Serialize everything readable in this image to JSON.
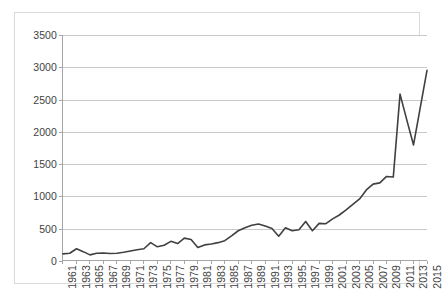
{
  "chart_data": {
    "type": "line",
    "title": "",
    "subtitle": "",
    "xlabel": "",
    "ylabel": "",
    "xlim": [
      1961,
      2015
    ],
    "ylim": [
      0,
      3500
    ],
    "ytick_step": 500,
    "yticks": [
      0,
      500,
      1000,
      1500,
      2000,
      2500,
      3000,
      3500
    ],
    "ytick_labels": [
      "0",
      "500",
      "1000",
      "1500",
      "2000",
      "2500",
      "3000",
      "3500"
    ],
    "xticks": [
      1961,
      1963,
      1965,
      1967,
      1969,
      1971,
      1973,
      1975,
      1977,
      1979,
      1981,
      1983,
      1985,
      1987,
      1989,
      1991,
      1993,
      1995,
      1997,
      1999,
      2001,
      2003,
      2005,
      2007,
      2009,
      2011,
      2013,
      2015
    ],
    "xtick_labels": [
      "1961",
      "1963",
      "1965",
      "1967",
      "1969",
      "1971",
      "1973",
      "1975",
      "1977",
      "1979",
      "1981",
      "1983",
      "1985",
      "1987",
      "1989",
      "1991",
      "1993",
      "1995",
      "1997",
      "1999",
      "2001",
      "2003",
      "2005",
      "2007",
      "2009",
      "2011",
      "2013",
      "2015"
    ],
    "grid": true,
    "grid_axis": "y",
    "legend": false,
    "legend_position": "none",
    "line_color": "#404040",
    "line_width": 1.6,
    "markers": false,
    "x": [
      1961,
      1962,
      1963,
      1964,
      1965,
      1966,
      1967,
      1968,
      1969,
      1970,
      1971,
      1972,
      1973,
      1974,
      1975,
      1976,
      1977,
      1978,
      1979,
      1980,
      1981,
      1982,
      1983,
      1984,
      1985,
      1986,
      1987,
      1988,
      1989,
      1990,
      1991,
      1992,
      1993,
      1994,
      1995,
      1996,
      1997,
      1998,
      1999,
      2000,
      2001,
      2002,
      2003,
      2004,
      2005,
      2006,
      2007,
      2008,
      2009,
      2010,
      2011,
      2012,
      2013,
      2014,
      2015
    ],
    "series": [
      {
        "name": "value",
        "values": [
          95,
          105,
          175,
          130,
          80,
          105,
          110,
          100,
          105,
          120,
          140,
          160,
          175,
          270,
          205,
          230,
          290,
          255,
          340,
          320,
          195,
          235,
          250,
          270,
          300,
          375,
          455,
          500,
          540,
          560,
          530,
          490,
          370,
          500,
          455,
          470,
          600,
          455,
          570,
          565,
          640,
          700,
          780,
          865,
          950,
          1090,
          1180,
          1200,
          1300,
          1290,
          2580,
          2180,
          1790,
          2370,
          2950
        ]
      }
    ]
  }
}
